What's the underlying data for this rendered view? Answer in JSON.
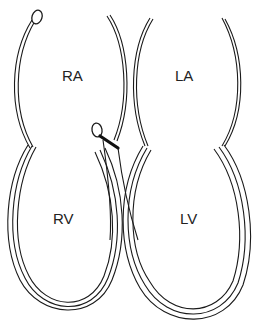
{
  "diagram": {
    "title": "",
    "chambers": [
      {
        "id": "ra",
        "label": "RA",
        "name": "Right atrium"
      },
      {
        "id": "la",
        "label": "LA",
        "name": "Left atrium"
      },
      {
        "id": "rv",
        "label": "RV",
        "name": "Right ventricle"
      },
      {
        "id": "lv",
        "label": "LV",
        "name": "Left ventricle"
      }
    ],
    "colors": {
      "line": "#1a1a1a",
      "background": "#ffffff"
    }
  }
}
